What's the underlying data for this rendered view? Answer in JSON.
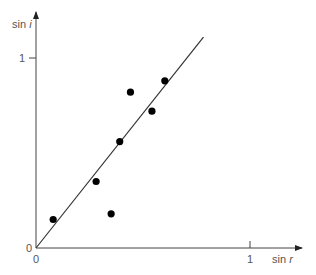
{
  "chart_data": {
    "type": "scatter",
    "title": "",
    "xlabel": "sin r",
    "ylabel": "sin i",
    "xlabel_parts": {
      "prefix": "sin ",
      "var": "r"
    },
    "ylabel_parts": {
      "prefix": "sin ",
      "var": "i"
    },
    "xlim": [
      0,
      1.25
    ],
    "ylim": [
      0,
      1.25
    ],
    "x_ticks": [
      {
        "value": 0,
        "label": "0"
      },
      {
        "value": 1,
        "label": "1"
      }
    ],
    "y_ticks": [
      {
        "value": 0,
        "label": "0"
      },
      {
        "value": 1,
        "label": "1"
      }
    ],
    "grid": false,
    "legend": null,
    "series": [
      {
        "name": "measurements",
        "marker": "filled-circle",
        "color": "#000000",
        "points": [
          {
            "x": 0.08,
            "y": 0.15
          },
          {
            "x": 0.28,
            "y": 0.35
          },
          {
            "x": 0.35,
            "y": 0.18
          },
          {
            "x": 0.39,
            "y": 0.56
          },
          {
            "x": 0.44,
            "y": 0.82
          },
          {
            "x": 0.54,
            "y": 0.72
          },
          {
            "x": 0.6,
            "y": 0.88
          }
        ]
      }
    ],
    "fit_line": {
      "name": "best-fit line",
      "color": "#333333",
      "from": {
        "x": 0,
        "y": 0
      },
      "to": {
        "x": 0.78,
        "y": 1.11
      }
    }
  },
  "axes": {
    "origin_x_label": "0",
    "origin_y_label": "0",
    "x_one_label": "1",
    "y_one_label": "1"
  },
  "colors": {
    "axis": "#444444",
    "points": "#000000",
    "line": "#333333",
    "labels": "#555555"
  }
}
